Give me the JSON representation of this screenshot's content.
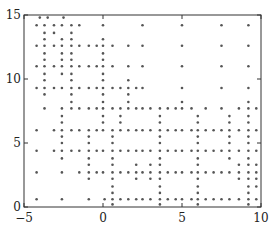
{
  "chart_data": {
    "type": "scatter",
    "title": "",
    "xlabel": "",
    "ylabel": "",
    "xlim": [
      -5,
      10
    ],
    "ylim": [
      0,
      15
    ],
    "grid": false,
    "legend": null,
    "x_ticks": [
      -5,
      0,
      5,
      10
    ],
    "y_ticks": [
      0,
      5,
      10,
      15
    ],
    "x_tick_labels": [
      "−5",
      "0",
      "5",
      "10"
    ],
    "y_tick_labels": [
      "0",
      "5",
      "10",
      "15"
    ],
    "marker": {
      "shape": "dot",
      "color": "#555555",
      "size": 1.3
    },
    "points": [
      [
        -4.0,
        14.8
      ],
      [
        -3.5,
        14.8
      ],
      [
        -2.5,
        14.8
      ],
      [
        -4.2,
        14.2
      ],
      [
        -3.7,
        14.2
      ],
      [
        -3.1,
        14.2
      ],
      [
        -2.6,
        14.2
      ],
      [
        -2.0,
        14.2
      ],
      [
        -1.5,
        14.2
      ],
      [
        0.0,
        14.2
      ],
      [
        2.5,
        14.2
      ],
      [
        5.0,
        14.2
      ],
      [
        7.5,
        14.2
      ],
      [
        9.2,
        14.2
      ],
      [
        -3.7,
        13.6
      ],
      [
        -3.1,
        13.6
      ],
      [
        -2.0,
        13.6
      ],
      [
        -3.7,
        13.1
      ],
      [
        -2.6,
        13.1
      ],
      [
        -2.0,
        13.1
      ],
      [
        0.0,
        13.1
      ],
      [
        -4.2,
        12.6
      ],
      [
        -3.7,
        12.6
      ],
      [
        -3.1,
        12.6
      ],
      [
        -2.6,
        12.6
      ],
      [
        -2.0,
        12.6
      ],
      [
        -1.5,
        12.6
      ],
      [
        -0.9,
        12.6
      ],
      [
        -0.4,
        12.6
      ],
      [
        0.0,
        12.6
      ],
      [
        0.6,
        12.6
      ],
      [
        1.6,
        12.6
      ],
      [
        2.5,
        12.6
      ],
      [
        5.0,
        12.6
      ],
      [
        7.5,
        12.6
      ],
      [
        9.2,
        12.6
      ],
      [
        -3.7,
        12.0
      ],
      [
        -2.6,
        12.0
      ],
      [
        -2.0,
        12.0
      ],
      [
        0.0,
        12.0
      ],
      [
        -3.7,
        11.5
      ],
      [
        -2.6,
        11.5
      ],
      [
        -2.0,
        11.5
      ],
      [
        0.0,
        11.5
      ],
      [
        -4.2,
        11.0
      ],
      [
        -3.7,
        11.0
      ],
      [
        -3.1,
        11.0
      ],
      [
        -2.6,
        11.0
      ],
      [
        -2.0,
        11.0
      ],
      [
        -1.5,
        11.0
      ],
      [
        -0.9,
        11.0
      ],
      [
        -0.4,
        11.0
      ],
      [
        0.0,
        11.0
      ],
      [
        0.6,
        11.0
      ],
      [
        1.6,
        11.0
      ],
      [
        2.5,
        11.0
      ],
      [
        5.0,
        11.0
      ],
      [
        7.5,
        11.0
      ],
      [
        9.2,
        11.0
      ],
      [
        -3.7,
        10.4
      ],
      [
        -2.6,
        10.4
      ],
      [
        -2.0,
        10.4
      ],
      [
        0.0,
        10.4
      ],
      [
        -3.7,
        9.9
      ],
      [
        -2.0,
        9.9
      ],
      [
        0.0,
        9.9
      ],
      [
        1.6,
        9.9
      ],
      [
        -4.2,
        9.3
      ],
      [
        -3.7,
        9.3
      ],
      [
        -3.1,
        9.3
      ],
      [
        -2.6,
        9.3
      ],
      [
        -2.0,
        9.3
      ],
      [
        -1.5,
        9.3
      ],
      [
        -0.9,
        9.3
      ],
      [
        -0.4,
        9.3
      ],
      [
        0.0,
        9.3
      ],
      [
        0.6,
        9.3
      ],
      [
        1.1,
        9.3
      ],
      [
        1.6,
        9.3
      ],
      [
        2.1,
        9.3
      ],
      [
        2.5,
        9.3
      ],
      [
        5.0,
        9.3
      ],
      [
        7.5,
        9.3
      ],
      [
        9.2,
        9.3
      ],
      [
        -3.7,
        8.8
      ],
      [
        -2.0,
        8.8
      ],
      [
        0.0,
        8.8
      ],
      [
        1.6,
        8.8
      ],
      [
        -2.0,
        8.2
      ],
      [
        0.0,
        8.2
      ],
      [
        1.6,
        8.2
      ],
      [
        5.0,
        8.2
      ],
      [
        9.2,
        8.2
      ],
      [
        -3.7,
        7.7
      ],
      [
        -2.6,
        7.7
      ],
      [
        -2.0,
        7.7
      ],
      [
        -1.5,
        7.7
      ],
      [
        -0.9,
        7.7
      ],
      [
        -0.4,
        7.7
      ],
      [
        0.0,
        7.7
      ],
      [
        0.6,
        7.7
      ],
      [
        1.1,
        7.7
      ],
      [
        1.6,
        7.7
      ],
      [
        2.1,
        7.7
      ],
      [
        2.5,
        7.7
      ],
      [
        3.0,
        7.7
      ],
      [
        3.6,
        7.7
      ],
      [
        4.1,
        7.7
      ],
      [
        4.6,
        7.7
      ],
      [
        5.0,
        7.7
      ],
      [
        5.6,
        7.7
      ],
      [
        6.5,
        7.7
      ],
      [
        7.5,
        7.7
      ],
      [
        8.6,
        7.7
      ],
      [
        9.2,
        7.7
      ],
      [
        9.7,
        7.7
      ],
      [
        -2.6,
        7.1
      ],
      [
        0.0,
        7.1
      ],
      [
        1.1,
        7.1
      ],
      [
        3.6,
        7.1
      ],
      [
        6.0,
        7.1
      ],
      [
        8.0,
        7.1
      ],
      [
        9.2,
        7.1
      ],
      [
        -2.6,
        6.6
      ],
      [
        0.0,
        6.6
      ],
      [
        1.1,
        6.6
      ],
      [
        3.6,
        6.6
      ],
      [
        6.0,
        6.6
      ],
      [
        8.0,
        6.6
      ],
      [
        9.2,
        6.6
      ],
      [
        -4.2,
        6.0
      ],
      [
        -3.1,
        6.0
      ],
      [
        -2.6,
        6.0
      ],
      [
        -2.0,
        6.0
      ],
      [
        -1.5,
        6.0
      ],
      [
        -0.9,
        6.0
      ],
      [
        -0.4,
        6.0
      ],
      [
        0.0,
        6.0
      ],
      [
        0.6,
        6.0
      ],
      [
        1.1,
        6.0
      ],
      [
        1.6,
        6.0
      ],
      [
        2.1,
        6.0
      ],
      [
        2.5,
        6.0
      ],
      [
        3.0,
        6.0
      ],
      [
        3.6,
        6.0
      ],
      [
        4.1,
        6.0
      ],
      [
        4.6,
        6.0
      ],
      [
        5.0,
        6.0
      ],
      [
        5.6,
        6.0
      ],
      [
        6.0,
        6.0
      ],
      [
        6.5,
        6.0
      ],
      [
        7.0,
        6.0
      ],
      [
        7.5,
        6.0
      ],
      [
        8.0,
        6.0
      ],
      [
        8.6,
        6.0
      ],
      [
        9.2,
        6.0
      ],
      [
        9.7,
        6.0
      ],
      [
        -2.6,
        5.5
      ],
      [
        -0.9,
        5.5
      ],
      [
        0.6,
        5.5
      ],
      [
        3.6,
        5.5
      ],
      [
        6.0,
        5.5
      ],
      [
        8.0,
        5.5
      ],
      [
        9.2,
        5.5
      ],
      [
        -2.6,
        5.0
      ],
      [
        -0.9,
        5.0
      ],
      [
        0.6,
        5.0
      ],
      [
        3.6,
        5.0
      ],
      [
        6.0,
        5.0
      ],
      [
        8.0,
        5.0
      ],
      [
        9.2,
        5.0
      ],
      [
        -4.2,
        4.4
      ],
      [
        -3.1,
        4.4
      ],
      [
        -2.6,
        4.4
      ],
      [
        -2.0,
        4.4
      ],
      [
        -1.5,
        4.4
      ],
      [
        -0.9,
        4.4
      ],
      [
        -0.4,
        4.4
      ],
      [
        0.0,
        4.4
      ],
      [
        0.6,
        4.4
      ],
      [
        1.1,
        4.4
      ],
      [
        1.6,
        4.4
      ],
      [
        2.1,
        4.4
      ],
      [
        2.5,
        4.4
      ],
      [
        3.0,
        4.4
      ],
      [
        3.6,
        4.4
      ],
      [
        4.1,
        4.4
      ],
      [
        4.6,
        4.4
      ],
      [
        5.0,
        4.4
      ],
      [
        5.6,
        4.4
      ],
      [
        6.0,
        4.4
      ],
      [
        6.5,
        4.4
      ],
      [
        7.0,
        4.4
      ],
      [
        7.5,
        4.4
      ],
      [
        8.0,
        4.4
      ],
      [
        8.6,
        4.4
      ],
      [
        9.2,
        4.4
      ],
      [
        9.7,
        4.4
      ],
      [
        -2.6,
        3.8
      ],
      [
        -0.9,
        3.8
      ],
      [
        0.6,
        3.8
      ],
      [
        3.6,
        3.8
      ],
      [
        6.0,
        3.8
      ],
      [
        8.0,
        3.8
      ],
      [
        9.2,
        3.8
      ],
      [
        -0.9,
        3.3
      ],
      [
        0.6,
        3.3
      ],
      [
        2.1,
        3.3
      ],
      [
        3.0,
        3.3
      ],
      [
        3.6,
        3.3
      ],
      [
        6.0,
        3.3
      ],
      [
        8.6,
        3.3
      ],
      [
        9.2,
        3.3
      ],
      [
        9.7,
        3.3
      ],
      [
        -4.2,
        2.7
      ],
      [
        -2.6,
        2.7
      ],
      [
        -1.5,
        2.7
      ],
      [
        -0.9,
        2.7
      ],
      [
        -0.4,
        2.7
      ],
      [
        0.0,
        2.7
      ],
      [
        0.6,
        2.7
      ],
      [
        1.1,
        2.7
      ],
      [
        1.6,
        2.7
      ],
      [
        2.1,
        2.7
      ],
      [
        2.5,
        2.7
      ],
      [
        3.0,
        2.7
      ],
      [
        3.6,
        2.7
      ],
      [
        4.1,
        2.7
      ],
      [
        4.6,
        2.7
      ],
      [
        5.0,
        2.7
      ],
      [
        5.6,
        2.7
      ],
      [
        6.0,
        2.7
      ],
      [
        6.5,
        2.7
      ],
      [
        7.0,
        2.7
      ],
      [
        7.5,
        2.7
      ],
      [
        8.0,
        2.7
      ],
      [
        8.6,
        2.7
      ],
      [
        9.2,
        2.7
      ],
      [
        9.7,
        2.7
      ],
      [
        -0.9,
        2.2
      ],
      [
        0.6,
        2.2
      ],
      [
        2.1,
        2.2
      ],
      [
        3.0,
        2.2
      ],
      [
        3.6,
        2.2
      ],
      [
        6.0,
        2.2
      ],
      [
        8.6,
        2.2
      ],
      [
        9.2,
        2.2
      ],
      [
        9.7,
        2.2
      ],
      [
        0.6,
        1.6
      ],
      [
        3.6,
        1.6
      ],
      [
        6.0,
        1.6
      ],
      [
        9.2,
        1.6
      ],
      [
        9.7,
        1.6
      ],
      [
        0.6,
        1.1
      ],
      [
        3.6,
        1.1
      ],
      [
        6.0,
        1.1
      ],
      [
        9.2,
        1.1
      ],
      [
        -4.2,
        0.6
      ],
      [
        -2.6,
        0.6
      ],
      [
        -0.9,
        0.6
      ],
      [
        0.1,
        0.6
      ],
      [
        0.6,
        0.6
      ],
      [
        1.1,
        0.6
      ],
      [
        1.6,
        0.6
      ],
      [
        2.1,
        0.6
      ],
      [
        2.5,
        0.6
      ],
      [
        3.0,
        0.6
      ],
      [
        3.6,
        0.6
      ],
      [
        4.1,
        0.6
      ],
      [
        4.6,
        0.6
      ],
      [
        5.0,
        0.6
      ],
      [
        5.6,
        0.6
      ],
      [
        6.0,
        0.6
      ],
      [
        6.5,
        0.6
      ],
      [
        7.0,
        0.6
      ],
      [
        7.5,
        0.6
      ],
      [
        8.0,
        0.6
      ],
      [
        8.6,
        0.6
      ],
      [
        9.2,
        0.6
      ],
      [
        9.7,
        0.6
      ],
      [
        0.6,
        0.2
      ],
      [
        3.6,
        0.2
      ],
      [
        6.0,
        0.2
      ],
      [
        9.2,
        0.2
      ]
    ]
  },
  "plot": {
    "axes_color": "#333333",
    "background": "#ffffff"
  }
}
